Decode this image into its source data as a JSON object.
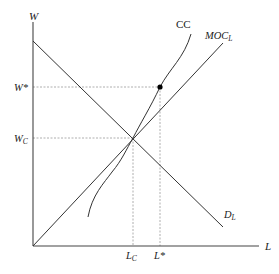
{
  "diagram": {
    "type": "monopsony labor market with comparable-worth / constraint curve",
    "axes": {
      "y_label": "W",
      "x_label": "L"
    },
    "curves": [
      {
        "id": "demand",
        "label_main": "D",
        "label_sub": "L",
        "kind": "line",
        "direction": "downward-sloping"
      },
      {
        "id": "moc",
        "label_main": "MOC",
        "label_sub": "L",
        "kind": "line",
        "direction": "upward-sloping"
      },
      {
        "id": "cc",
        "label_main": "CC",
        "label_sub": "",
        "kind": "curve",
        "direction": "upward-sloping S-shaped"
      }
    ],
    "reference_points": {
      "wc_label_main": "W",
      "wc_label_sub": "C",
      "wstar_label": "W*",
      "lc_label_main": "L",
      "lc_label_sub": "C",
      "lstar_label": "L*"
    },
    "colors": {
      "line": "#333333",
      "dashed": "#999999",
      "dot": "#000000"
    }
  }
}
